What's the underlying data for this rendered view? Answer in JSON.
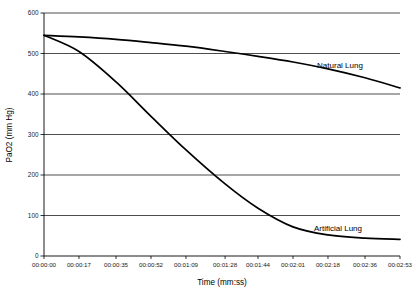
{
  "chart_data": {
    "type": "line",
    "title": "",
    "xlabel": "Time (mm:ss)",
    "ylabel": "PaO2 (mm Hg)",
    "ylim": [
      0,
      600
    ],
    "yticks": [
      0,
      100,
      200,
      300,
      400,
      500,
      600
    ],
    "ytick_labels": [
      "0",
      "100",
      "200",
      "300",
      "400",
      "500",
      "600"
    ],
    "grid": "horizontal",
    "legend_position": "inline-annotation-right",
    "x": [
      0,
      17,
      35,
      52,
      69,
      88,
      104,
      121,
      138,
      156,
      173
    ],
    "xtick_labels": [
      "00:00:00",
      "00:00:17",
      "00:00:35",
      "00:00:52",
      "00:01:09",
      "00:01:28",
      "00:01:44",
      "00:02:01",
      "00:02:18",
      "00:02:36",
      "00:02:53"
    ],
    "series": [
      {
        "name": "Natural Lung",
        "color": "#000000",
        "values": [
          545,
          541,
          535,
          527,
          518,
          505,
          493,
          479,
          462,
          440,
          415
        ]
      },
      {
        "name": "Artificial Lung",
        "color": "#000000",
        "values": [
          545,
          505,
          430,
          345,
          262,
          178,
          118,
          72,
          52,
          44,
          41
        ]
      }
    ],
    "annotations": [
      {
        "text": "Natural Lung",
        "series": "Natural Lung"
      },
      {
        "text": "Artificial Lung",
        "series": "Artificial Lung"
      }
    ]
  }
}
